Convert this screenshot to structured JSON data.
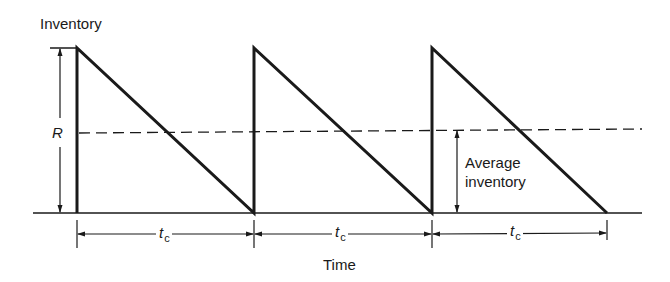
{
  "diagram": {
    "y_axis_label": "Inventory",
    "x_axis_label": "Time",
    "reorder_quantity_label": "R",
    "average_label_line1": "Average",
    "average_label_line2": "inventory",
    "cycle_label_main": "t",
    "cycle_label_sub": "c",
    "cycles": [
      {
        "label": "t",
        "sub": "c"
      },
      {
        "label": "t",
        "sub": "c"
      },
      {
        "label": "t",
        "sub": "c"
      }
    ],
    "colors": {
      "line": "#1a1a1a",
      "background": "#ffffff"
    }
  }
}
